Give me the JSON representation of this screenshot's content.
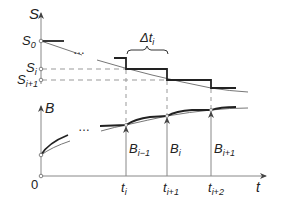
{
  "diagram": {
    "axes": {
      "s_axis_label": "S",
      "b_axis_label": "B",
      "t_axis_label": "t",
      "origin_label": "0"
    },
    "s_levels": [
      {
        "base": "S",
        "sub": "0"
      },
      {
        "base": "S",
        "sub": "i"
      },
      {
        "base": "S",
        "sub": "i+1"
      }
    ],
    "interval_label": {
      "base": "Δt",
      "sub": "i"
    },
    "time_ticks": [
      {
        "base": "t",
        "sub": "i"
      },
      {
        "base": "t",
        "sub": "i+1"
      },
      {
        "base": "t",
        "sub": "i+2"
      }
    ],
    "b_markers": [
      {
        "base": "B",
        "sub": "i−1"
      },
      {
        "base": "B",
        "sub": "i"
      },
      {
        "base": "B",
        "sub": "i+1"
      }
    ],
    "ellipsis": "…",
    "colors": {
      "axis": "#888888",
      "curve_thin": "#777777",
      "step_thick": "#222222",
      "dashed": "#999999"
    }
  }
}
